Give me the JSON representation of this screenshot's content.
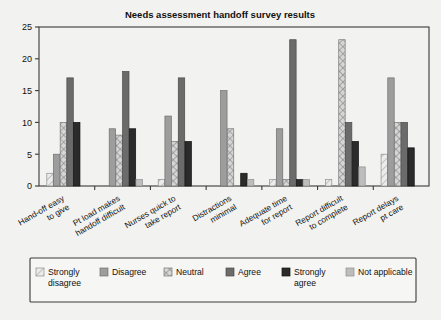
{
  "chart_data": {
    "type": "bar",
    "title": "Needs assessment handoff survey results",
    "xlabel": "",
    "ylabel": "",
    "ylim": [
      0,
      25
    ],
    "yticks": [
      0,
      5,
      10,
      15,
      20,
      25
    ],
    "grid": false,
    "legend_position": "bottom",
    "categories": [
      "Hand-off easy to give",
      "Pt load makes handoff difficult",
      "Nurses quick to take report",
      "Distractions minimal",
      "Adequate time for report",
      "Report difficult to complete",
      "Report delays pt care"
    ],
    "category_lines": [
      [
        "Hand-off easy",
        "to give"
      ],
      [
        "Pt load makes",
        "handoff difficult"
      ],
      [
        "Nurses quick to",
        "take report"
      ],
      [
        "Distractions",
        "minimal"
      ],
      [
        "Adequate time",
        "for report"
      ],
      [
        "Report difficult",
        "to complete"
      ],
      [
        "Report delays",
        "pt care"
      ]
    ],
    "series": [
      {
        "name": "Strongly disagree",
        "values": [
          2,
          0,
          1,
          0,
          1,
          1,
          5
        ]
      },
      {
        "name": "Disagree",
        "values": [
          5,
          9,
          11,
          15,
          9,
          0,
          17
        ]
      },
      {
        "name": "Neutral",
        "values": [
          10,
          8,
          7,
          9,
          1,
          23,
          10
        ]
      },
      {
        "name": "Agree",
        "values": [
          17,
          18,
          17,
          0,
          23,
          10,
          10
        ]
      },
      {
        "name": "Strongly agree",
        "values": [
          10,
          9,
          7,
          2,
          1,
          7,
          6
        ]
      },
      {
        "name": "Not applicable",
        "values": [
          0,
          1,
          0,
          1,
          1,
          3,
          0
        ]
      }
    ]
  },
  "legend": {
    "items": [
      {
        "label_lines": [
          "Strongly",
          "disagree"
        ],
        "swatch": "hatch-light"
      },
      {
        "label_lines": [
          "Disagree"
        ],
        "swatch": "solid-mid"
      },
      {
        "label_lines": [
          "Neutral"
        ],
        "swatch": "crosshatch"
      },
      {
        "label_lines": [
          "Agree"
        ],
        "swatch": "solid-dark"
      },
      {
        "label_lines": [
          "Strongly",
          "agree"
        ],
        "swatch": "solid-black"
      },
      {
        "label_lines": [
          "Not applicable"
        ],
        "swatch": "solid-lightgray"
      }
    ]
  },
  "colors": {
    "background": "#f2f2f0",
    "axis": "#3a3a3a",
    "text": "#111111",
    "series_fills": [
      "#e8e8e8",
      "#9d9d9d",
      "#cfcfcf",
      "#6b6b6b",
      "#2b2b2b",
      "#bdbdbd"
    ]
  }
}
